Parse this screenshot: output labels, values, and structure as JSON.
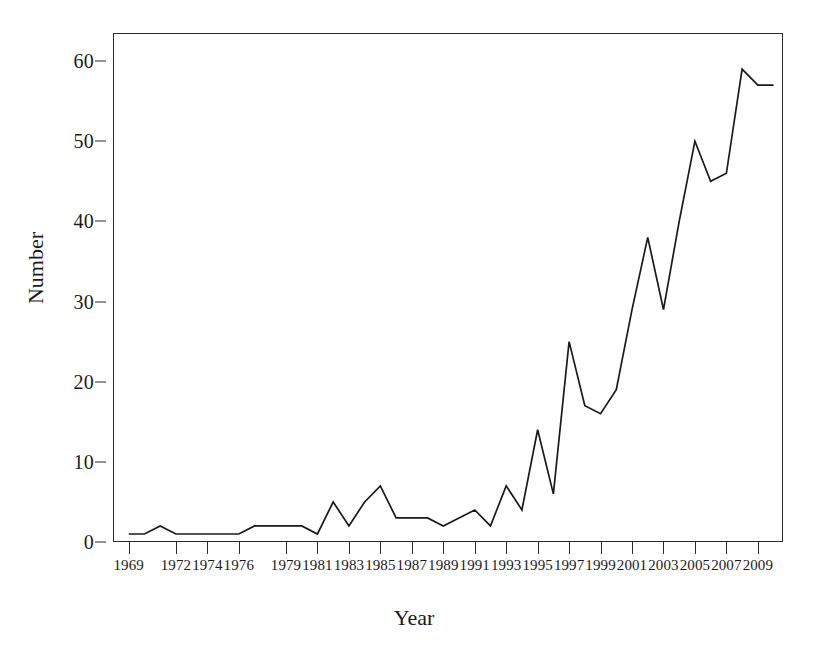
{
  "chart_data": {
    "type": "line",
    "title": "",
    "xlabel": "Year",
    "ylabel": "Number",
    "xlim": [
      1968,
      2010.6
    ],
    "ylim": [
      0,
      63.5
    ],
    "grid": false,
    "legend": null,
    "line_color": "#1a1a1a",
    "x_tick_labels": [
      "1969",
      "1972",
      "1974",
      "1976",
      "1979",
      "1981",
      "1983",
      "1985",
      "1987",
      "1989",
      "1991",
      "1993",
      "1995",
      "1997",
      "1999",
      "2001",
      "2003",
      "2005",
      "2007",
      "2009"
    ],
    "x_tick_values": [
      1969,
      1972,
      1974,
      1976,
      1979,
      1981,
      1983,
      1985,
      1987,
      1989,
      1991,
      1993,
      1995,
      1997,
      1999,
      2001,
      2003,
      2005,
      2007,
      2009
    ],
    "y_tick_labels": [
      "0",
      "10",
      "20",
      "30",
      "40",
      "50",
      "60"
    ],
    "y_tick_values": [
      0,
      10,
      20,
      30,
      40,
      50,
      60
    ],
    "x": [
      1969,
      1970,
      1971,
      1972,
      1973,
      1974,
      1975,
      1976,
      1977,
      1978,
      1979,
      1980,
      1981,
      1982,
      1983,
      1984,
      1985,
      1986,
      1987,
      1988,
      1989,
      1990,
      1991,
      1992,
      1993,
      1994,
      1995,
      1996,
      1997,
      1998,
      1999,
      2000,
      2001,
      2002,
      2003,
      2004,
      2005,
      2006,
      2007,
      2008,
      2009,
      2010
    ],
    "values": [
      1,
      1,
      2,
      1,
      1,
      1,
      1,
      1,
      2,
      2,
      2,
      2,
      1,
      5,
      2,
      5,
      7,
      3,
      3,
      3,
      2,
      3,
      4,
      2,
      7,
      4,
      14,
      6,
      25,
      17,
      16,
      19,
      29,
      38,
      29,
      40,
      50,
      45,
      46,
      59,
      57,
      57
    ],
    "series_name": "Number"
  }
}
